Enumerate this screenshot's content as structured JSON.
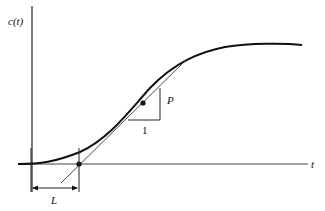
{
  "diagram": {
    "y_axis_label": "c(t)",
    "x_axis_label": "t",
    "slope_run_label": "1",
    "slope_rise_label": "P",
    "delay_label": "L",
    "type": "step response S-curve with inflection tangent",
    "colors": {
      "ink": "#111111",
      "background": "#ffffff"
    }
  }
}
